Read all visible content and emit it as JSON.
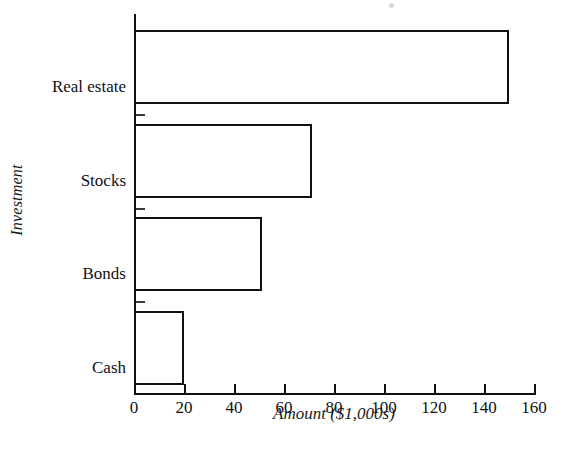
{
  "chart_data": {
    "type": "bar",
    "orientation": "horizontal",
    "title": "",
    "xlabel": "Amount ($1,000s)",
    "ylabel": "Investment",
    "categories": [
      "Real estate",
      "Stocks",
      "Bonds",
      "Cash"
    ],
    "values": [
      150,
      71,
      51,
      20
    ],
    "series": [
      {
        "name": "Amount",
        "values": [
          150,
          71,
          51,
          20
        ]
      }
    ],
    "xlim": [
      0,
      160
    ],
    "xticks": [
      0,
      20,
      40,
      60,
      80,
      100,
      120,
      140,
      160
    ],
    "xtick_labels": [
      "0",
      "20",
      "40",
      "60",
      "80",
      "100",
      "120",
      "140",
      "160"
    ],
    "grid": false,
    "legend": false,
    "legend_position": "none",
    "bar_style": {
      "fill": "#ffffff",
      "edge_color": "#111111",
      "edge_width": 2.5
    },
    "axis_color": "#111111",
    "background": "#ffffff",
    "annotations": []
  }
}
